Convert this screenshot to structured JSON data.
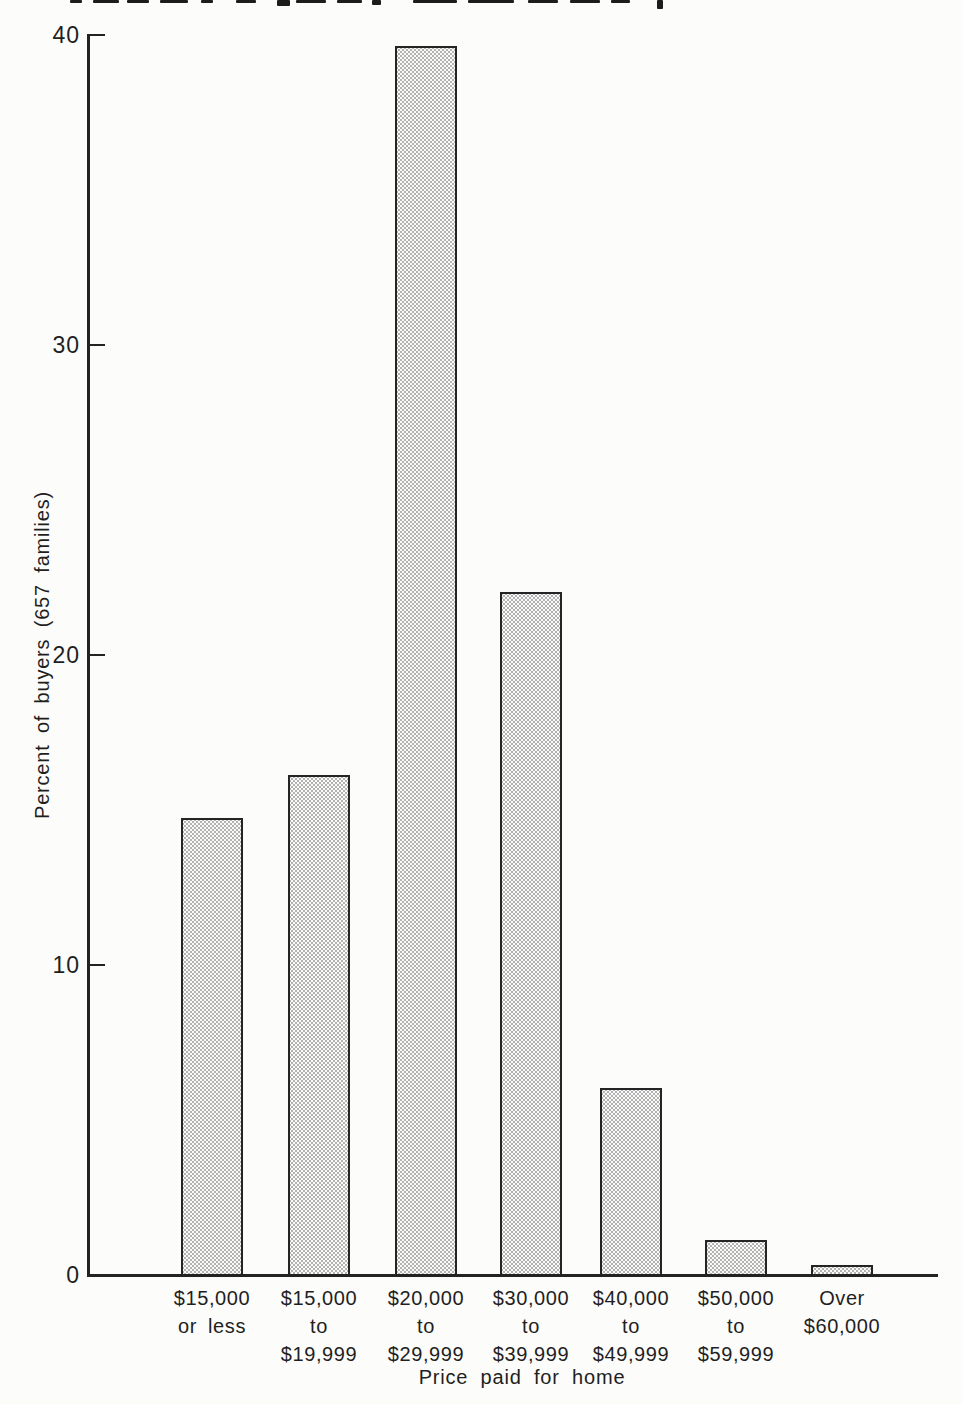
{
  "page": {
    "paper_color": "#fcfcfa",
    "ink_color": "#232323"
  },
  "chart_data": {
    "type": "bar",
    "title": "",
    "xlabel": "Price paid for home",
    "ylabel": "Percent of buyers (657 families)",
    "categories": [
      "$15,000 or less",
      "$15,000 to $19,999",
      "$20,000 to $29,999",
      "$30,000 to $39,999",
      "$40,000 to $49,999",
      "$50,000 to $59,999",
      "Over $60,000"
    ],
    "category_lines": [
      [
        "$15,000",
        "or less"
      ],
      [
        "$15,000",
        "to",
        "$19,999"
      ],
      [
        "$20,000",
        "to",
        "$29,999"
      ],
      [
        "$30,000",
        "to",
        "$39,999"
      ],
      [
        "$40,000",
        "to",
        "$49,999"
      ],
      [
        "$50,000",
        "to",
        "$59,999"
      ],
      [
        "Over",
        "$60,000"
      ]
    ],
    "values": [
      14.7,
      16.1,
      39.6,
      22.0,
      6.0,
      1.1,
      0.3
    ],
    "ylim": [
      0,
      40
    ],
    "yticks": [
      0,
      10,
      20,
      30,
      40
    ],
    "grid": false,
    "legend": null,
    "bar_fill": "stippled-halftone-dots",
    "bar_fill_dot_color": "#b2b2b2",
    "bar_border_color": "#242424"
  }
}
